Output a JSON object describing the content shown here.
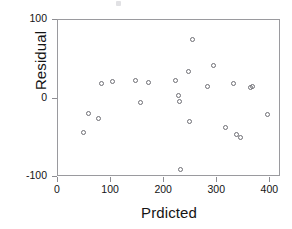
{
  "chart_data": {
    "type": "scatter",
    "title": "",
    "xlabel": "Prdicted",
    "ylabel": "Residual",
    "xlim": [
      0,
      420
    ],
    "ylim": [
      -100,
      100
    ],
    "xticks": [
      0,
      100,
      200,
      300,
      400
    ],
    "yticks": [
      100,
      0,
      -100
    ],
    "xtick_labels": [
      "0",
      "100",
      "200",
      "300",
      "400"
    ],
    "ytick_labels": [
      "100",
      "0",
      "-100"
    ],
    "grid": false,
    "legend": null,
    "marker": "open-circle",
    "series": [
      {
        "name": "residuals",
        "points": [
          {
            "x": 49,
            "y": -45
          },
          {
            "x": 60,
            "y": -20
          },
          {
            "x": 78,
            "y": -27
          },
          {
            "x": 83,
            "y": 18
          },
          {
            "x": 105,
            "y": 20
          },
          {
            "x": 148,
            "y": 22
          },
          {
            "x": 158,
            "y": -7
          },
          {
            "x": 173,
            "y": 19
          },
          {
            "x": 224,
            "y": 22
          },
          {
            "x": 229,
            "y": 2
          },
          {
            "x": 231,
            "y": -5
          },
          {
            "x": 232,
            "y": -92
          },
          {
            "x": 248,
            "y": 33
          },
          {
            "x": 250,
            "y": -30
          },
          {
            "x": 256,
            "y": 74
          },
          {
            "x": 284,
            "y": 14
          },
          {
            "x": 294,
            "y": 41
          },
          {
            "x": 318,
            "y": -38
          },
          {
            "x": 332,
            "y": 18
          },
          {
            "x": 338,
            "y": -47
          },
          {
            "x": 345,
            "y": -51
          },
          {
            "x": 364,
            "y": 13
          },
          {
            "x": 368,
            "y": 14
          },
          {
            "x": 397,
            "y": -22
          }
        ]
      }
    ]
  },
  "axis": {
    "y_title": "Residual",
    "x_title": "Prdicted"
  },
  "colors": {
    "marker_stroke": "#6e6e74",
    "frame": "#9a9a9e",
    "text": "#141414",
    "background": "#ffffff"
  }
}
